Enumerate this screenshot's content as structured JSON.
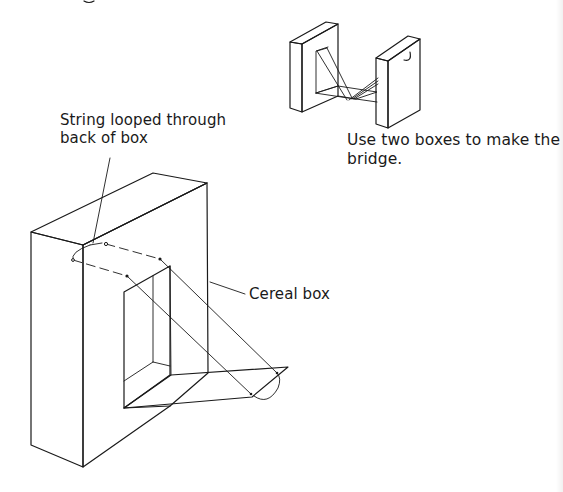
{
  "figure": {
    "small_illustration": {
      "caption_lines": [
        "Use two boxes to make the",
        "bridge."
      ]
    },
    "main_illustration": {
      "callouts": {
        "string": [
          "String looped through",
          "back of box"
        ],
        "box": "Cereal box"
      }
    }
  },
  "colors": {
    "ink": "#1a1a1a",
    "background": "#ffffff"
  }
}
